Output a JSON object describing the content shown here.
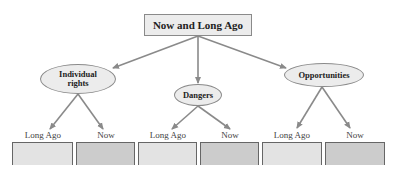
{
  "diagram": {
    "root": {
      "label": "Now and Long Ago"
    },
    "branches": [
      {
        "label_line1": "Individual",
        "label_line2": "rights",
        "leaves": [
          {
            "label": "Long Ago"
          },
          {
            "label": "Now"
          }
        ]
      },
      {
        "label_line1": "Dangers",
        "label_line2": "",
        "leaves": [
          {
            "label": "Long Ago"
          },
          {
            "label": "Now"
          }
        ]
      },
      {
        "label_line1": "Opportunities",
        "label_line2": "",
        "leaves": [
          {
            "label": "Long Ago"
          },
          {
            "label": "Now"
          }
        ]
      }
    ],
    "colors": {
      "node_fill": "#ececec",
      "node_border": "#8a8a8a",
      "arrow": "#8a8a8a",
      "long_ago_box": "#e3e3e3",
      "now_box": "#cccccc"
    }
  }
}
